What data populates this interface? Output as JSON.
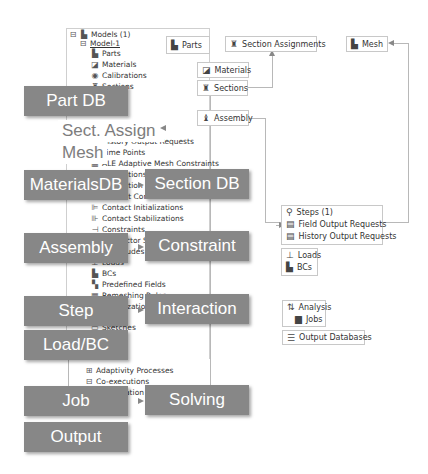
{
  "tree": {
    "root": "Models (1)",
    "model": "Model-1",
    "items": [
      {
        "label": "Parts",
        "icon": "part-icon"
      },
      {
        "label": "Materials",
        "icon": "material-icon"
      },
      {
        "label": "Calibrations",
        "icon": "calibration-icon"
      },
      {
        "label": "Sections",
        "icon": "section-icon"
      },
      {
        "label": "History Output Requests",
        "icon": "history-output-icon"
      },
      {
        "label": "Time Points",
        "icon": "time-points-icon"
      },
      {
        "label": "ALE Adaptive Mesh Constraints",
        "icon": "ale-mesh-icon"
      },
      {
        "label": "Interactions",
        "icon": "interaction-icon"
      },
      {
        "label": "Interaction Properties",
        "icon": "interaction-property-icon"
      },
      {
        "label": "Contact Controls",
        "icon": "contact-controls-icon"
      },
      {
        "label": "Contact Initializations",
        "icon": "contact-init-icon"
      },
      {
        "label": "Contact Stabilizations",
        "icon": "contact-stab-icon"
      },
      {
        "label": "Constraints",
        "icon": "constraint-icon"
      },
      {
        "label": "Connector Sections",
        "icon": "connector-icon"
      },
      {
        "label": "Amplitudes",
        "icon": "amplitude-icon"
      },
      {
        "label": "Loads",
        "icon": "load-icon"
      },
      {
        "label": "BCs",
        "icon": "bc-icon"
      },
      {
        "label": "Predefined Fields",
        "icon": "predefined-field-icon"
      },
      {
        "label": "Remeshing Rules",
        "icon": "remeshing-icon"
      },
      {
        "label": "Optimization Tasks",
        "icon": "optimization-icon"
      },
      {
        "label": "Sketches",
        "icon": "sketch-icon"
      },
      {
        "label": "Adaptivity Processes",
        "icon": "adaptivity-icon"
      },
      {
        "label": "Co-executions",
        "icon": "coexecution-icon"
      },
      {
        "label": "Optimization Processes",
        "icon": "optimization-process-icon"
      }
    ]
  },
  "nodes": {
    "parts": "Parts",
    "section_assignments": "Section Assignments",
    "mesh": "Mesh",
    "materials": "Materials",
    "sections": "Sections",
    "assembly": "Assembly",
    "steps": "Steps (1)",
    "field_output": "Field Output Requests",
    "history_output": "History Output Requests",
    "loads": "Loads",
    "bcs": "BCs",
    "analysis": "Analysis",
    "jobs": "Jobs",
    "output_db": "Output Databases"
  },
  "labels": {
    "part_db": "Part DB",
    "sect_assign": "Sect. Assign",
    "mesh": "Mesh",
    "materials_db": "MaterialsDB",
    "section_db": "Section DB",
    "assembly": "Assembly",
    "constraint": "Constraint",
    "step": "Step",
    "interaction": "Interaction",
    "load_bc": "Load/BC",
    "job": "Job",
    "solving": "Solving",
    "output": "Output"
  },
  "colors": {
    "label_bg": "#878787",
    "label_text": "#ffffff",
    "line": "#b8b8b8"
  }
}
